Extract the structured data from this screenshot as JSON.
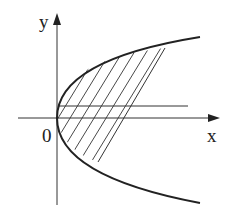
{
  "diagram": {
    "type": "parabola-shaded-region",
    "labels": {
      "y_axis": "y",
      "x_axis": "x",
      "origin": "0"
    },
    "colors": {
      "stroke": "#222222",
      "background": "#ffffff"
    },
    "elements": [
      "x-axis with arrow",
      "y-axis with arrow",
      "parabola opening right with vertex at origin",
      "horizontal line above x-axis",
      "hatched region between parabola and slanted line"
    ]
  }
}
